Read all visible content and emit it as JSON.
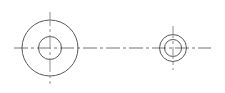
{
  "drawing": {
    "type": "engineering-part-drawing",
    "title": "Two concentric circular features with centerlines",
    "canvas": {
      "width": 225,
      "height": 93,
      "background": "#ffffff"
    },
    "styles": {
      "outline_color": "#5a5a5e",
      "centerline_color": "#8e8e95",
      "centerline_horizontal_color": "#757579",
      "outline_width": 1,
      "centerline_width": 1,
      "centerline_dash_pattern": "14 3 3 3"
    },
    "features": [
      {
        "name": "left-boss",
        "label": "Left circular feature",
        "center": {
          "x": 50,
          "y": 48
        },
        "circles": [
          {
            "name": "outer",
            "radius": 28
          },
          {
            "name": "inner",
            "radius": 11.5
          }
        ],
        "centerline_vertical": {
          "y1": 12,
          "y2": 84
        }
      },
      {
        "name": "right-boss",
        "label": "Right circular feature",
        "center": {
          "x": 173,
          "y": 48
        },
        "circles": [
          {
            "name": "outer",
            "radius": 13.5
          },
          {
            "name": "inner",
            "radius": 8.5
          }
        ],
        "centerline_vertical": {
          "y1": 26,
          "y2": 70
        }
      }
    ],
    "axis": {
      "name": "horizontal-centerline",
      "label": "Shared horizontal axis",
      "x1": 14,
      "x2": 211,
      "y": 48
    }
  },
  "chart_data": {
    "type": "scatter",
    "xlabel": "",
    "ylabel": "",
    "xlim": [
      0,
      225
    ],
    "ylim": [
      0,
      93
    ],
    "grid": false,
    "legend": "none",
    "series": [
      {
        "name": "left-boss-outer-circle",
        "shape": "circle",
        "cx": 50,
        "cy": 48,
        "r": 28
      },
      {
        "name": "left-boss-inner-circle",
        "shape": "circle",
        "cx": 50,
        "cy": 48,
        "r": 11.5
      },
      {
        "name": "right-boss-outer-circle",
        "shape": "circle",
        "cx": 173,
        "cy": 48,
        "r": 13.5
      },
      {
        "name": "right-boss-inner-circle",
        "shape": "circle",
        "cx": 173,
        "cy": 48,
        "r": 8.5
      },
      {
        "name": "horizontal-centerline",
        "shape": "line",
        "x1": 14,
        "y1": 48,
        "x2": 211,
        "y2": 48
      },
      {
        "name": "left-vertical-centerline",
        "shape": "line",
        "x1": 50,
        "y1": 12,
        "x2": 50,
        "y2": 84
      },
      {
        "name": "right-vertical-centerline",
        "shape": "line",
        "x1": 173,
        "y1": 26,
        "x2": 173,
        "y2": 70
      }
    ]
  }
}
